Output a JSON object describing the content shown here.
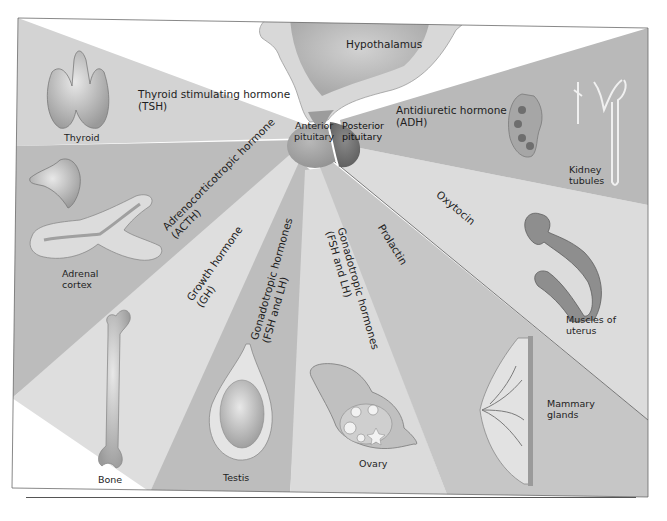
{
  "diagram": {
    "center": {
      "hypothalamus": "Hypothalamus",
      "anterior_pituitary": [
        "Anterior",
        "pituitary"
      ],
      "posterior_pituitary": [
        "Posterior",
        "pituitary"
      ]
    },
    "hormones": {
      "tsh": [
        "Thyroid stimulating hormone",
        "(TSH)"
      ],
      "acth": [
        "Adrenocorticotropic hormone",
        "(ACTH)"
      ],
      "gh": [
        "Growth hormone",
        "(GH)"
      ],
      "gonado_male": [
        "Gonadotropic hormones",
        "(FSH and LH)"
      ],
      "gonado_female": [
        "Gonadotropic hormones",
        "(FSH and LH)"
      ],
      "prolactin": "Prolactin",
      "oxytocin": "Oxytocin",
      "adh": [
        "Antidiuretic hormone",
        "(ADH)"
      ]
    },
    "targets": {
      "thyroid": "Thyroid",
      "adrenal": [
        "Adrenal",
        "cortex"
      ],
      "bone": "Bone",
      "testis": "Testis",
      "ovary": "Ovary",
      "mammary": [
        "Mammary",
        "glands"
      ],
      "uterus": [
        "Muscles of",
        "uterus"
      ],
      "kidney": [
        "Kidney",
        "tubules"
      ]
    },
    "colors": {
      "background": "#ffffff",
      "light_ray": "#dcdcdc",
      "mid_ray": "#c4c4c4",
      "dark_ray": "#b0b0b0",
      "hypothalamus": "#bdbdbd",
      "anterior": "#a8a8a8",
      "posterior": "#6e6e6e"
    }
  }
}
